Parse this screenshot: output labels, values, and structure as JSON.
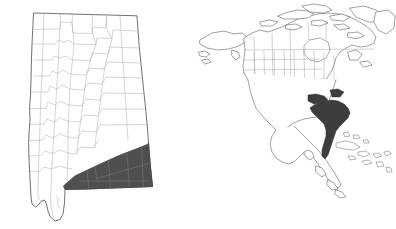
{
  "figure": {
    "type": "locator-map",
    "panel_count": 2,
    "background_color": "#ffffff",
    "width": 396,
    "height": 229
  },
  "colors": {
    "background": "#ffffff",
    "highlight_fill": "#4f4f4f",
    "state_outline": "#4c4c4c",
    "county_line": "#b2b2b2",
    "context_land_outline": "#555555",
    "context_admin_line": "#9a9a9a",
    "context_highlight_fill": "#3d3d3d"
  },
  "left_panel": {
    "name": "state-detail-map",
    "subject": "Alabama",
    "description": "Outline map of the state of Alabama subdivided into counties, with a band of counties across the southeastern part of the state shaded dark gray.",
    "has_labels": false,
    "has_legend": false,
    "highlight": {
      "label": "highlighted-county-region",
      "fill": "#4f4f4f",
      "position": "southeast"
    }
  },
  "right_panel": {
    "name": "context-map",
    "subject": "North America",
    "description": "Outline map of North America including Canada, the United States with state boundaries, Mexico, Central America and the Caribbean islands, with the southeastern United States Atlantic coastal region shaded dark gray.",
    "has_labels": false,
    "has_legend": false,
    "highlight": {
      "label": "highlighted-region",
      "fill": "#3d3d3d",
      "position": "southeastern-united-states"
    }
  }
}
